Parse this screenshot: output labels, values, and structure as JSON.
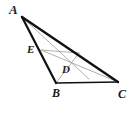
{
  "figure": {
    "kind": "geometry-diagram",
    "shape": "triangle",
    "background_color": "#ffffff",
    "outline_color": "#111111",
    "cevian_color": "#9a9a9a",
    "label_color": "#1a1a1a",
    "outline_width": 2.2,
    "cevian_width": 0.8,
    "canvas": {
      "width": 132,
      "height": 114
    }
  },
  "points": {
    "A": {
      "label": "A",
      "x": 22,
      "y": 17,
      "label_x": 9,
      "label_y": 3,
      "font_size": 13
    },
    "B": {
      "label": "B",
      "x": 56,
      "y": 83,
      "label_x": 52,
      "label_y": 87,
      "font_size": 12
    },
    "C": {
      "label": "C",
      "x": 118,
      "y": 82,
      "label_x": 118,
      "label_y": 88,
      "font_size": 12
    },
    "D": {
      "label": "D",
      "x": 66,
      "y": 64,
      "label_x": 62,
      "label_y": 64,
      "font_size": 11
    },
    "E": {
      "label": "E",
      "x": 41,
      "y": 50,
      "label_x": 27,
      "label_y": 44,
      "font_size": 11
    },
    "F": {
      "label": "",
      "x": 79,
      "y": 53,
      "label_x": 0,
      "label_y": 0,
      "font_size": 0
    },
    "G": {
      "label": "",
      "x": 89,
      "y": 79,
      "label_x": 0,
      "label_y": 0,
      "font_size": 0
    }
  },
  "segments": {
    "outline": [
      {
        "name": "side-AB",
        "from": "A",
        "to": "B",
        "x1": 22,
        "y1": 17,
        "x2": 56,
        "y2": 83
      },
      {
        "name": "side-BC",
        "from": "B",
        "to": "C",
        "x1": 56,
        "y1": 83,
        "x2": 118,
        "y2": 82
      },
      {
        "name": "side-AC",
        "from": "A",
        "to": "C",
        "x1": 22,
        "y1": 17,
        "x2": 118,
        "y2": 82
      }
    ],
    "cevians": [
      {
        "name": "cevian-A-to-BC",
        "from": "A",
        "to": "G",
        "x1": 22,
        "y1": 17,
        "x2": 89,
        "y2": 79
      },
      {
        "name": "cevian-E-to-C",
        "from": "E",
        "to": "C",
        "x1": 41,
        "y1": 50,
        "x2": 118,
        "y2": 82
      },
      {
        "name": "cevian-B-to-AC",
        "from": "B",
        "to": "F",
        "x1": 56,
        "y1": 83,
        "x2": 79,
        "y2": 53
      },
      {
        "name": "cevian-E-to-AC",
        "from": "E",
        "to": "F",
        "x1": 41,
        "y1": 50,
        "x2": 79,
        "y2": 53
      }
    ]
  },
  "labels": [
    "A",
    "B",
    "C",
    "D",
    "E"
  ]
}
